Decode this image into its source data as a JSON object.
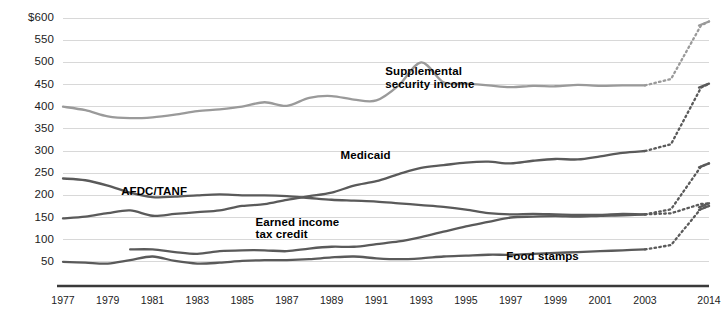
{
  "chart_data": {
    "type": "line",
    "title": "",
    "subtitle": "",
    "xlabel": "",
    "ylabel": "",
    "currency_prefix": "$",
    "units_note": "billions of dollars",
    "xlim": [
      1977,
      2014
    ],
    "ylim": [
      0,
      600
    ],
    "ytick_step": 50,
    "grid": true,
    "legend": "inline-labels",
    "ytick_labels": [
      "$600",
      "550",
      "500",
      "450",
      "400",
      "350",
      "300",
      "250",
      "200",
      "150",
      "100",
      "50"
    ],
    "ytick_values": [
      600,
      550,
      500,
      450,
      400,
      350,
      300,
      250,
      200,
      150,
      100,
      50
    ],
    "xtick_labels": [
      "1977",
      "1979",
      "1981",
      "1983",
      "1985",
      "1987",
      "1989",
      "1991",
      "1993",
      "1995",
      "1997",
      "1999",
      "2001",
      "2003",
      "2014"
    ],
    "xtick_values": [
      1977,
      1979,
      1981,
      1983,
      1985,
      1987,
      1989,
      1991,
      1993,
      1995,
      1997,
      1999,
      2001,
      2003,
      2014
    ],
    "projection_note": "Dotted segments from 2003 to 2014 are projected values",
    "colors": {
      "light_gray_line": "#9a9a9a",
      "dark_gray_line": "#5a5a5a",
      "gridline": "#d8d8d8",
      "axis": "#3a3a3a",
      "text": "#1c1c1c"
    },
    "series": [
      {
        "name": "Supplemental security income",
        "color": "#9a9a9a",
        "label_x": 1991.4,
        "label_y": 478,
        "x": [
          1977,
          1978,
          1979,
          1980,
          1981,
          1982,
          1983,
          1984,
          1985,
          1986,
          1987,
          1988,
          1989,
          1990,
          1991,
          1992,
          1993,
          1994,
          1995,
          1996,
          1997,
          1998,
          1999,
          2000,
          2001,
          2002,
          2003,
          2014
        ],
        "values": [
          400,
          392,
          378,
          374,
          376,
          382,
          390,
          394,
          400,
          410,
          402,
          420,
          424,
          416,
          414,
          448,
          500,
          455,
          452,
          448,
          444,
          447,
          446,
          449,
          447,
          448,
          448,
          592
        ],
        "projected_from": 2003
      },
      {
        "name": "Medicaid",
        "color": "#5a5a5a",
        "label_x": 1989.4,
        "label_y": 288,
        "x": [
          1977,
          1978,
          1979,
          1980,
          1981,
          1982,
          1983,
          1984,
          1985,
          1986,
          1987,
          1988,
          1989,
          1990,
          1991,
          1992,
          1993,
          1994,
          1995,
          1996,
          1997,
          1998,
          1999,
          2000,
          2001,
          2002,
          2003,
          2014
        ],
        "values": [
          148,
          152,
          160,
          166,
          154,
          158,
          162,
          166,
          176,
          180,
          190,
          198,
          206,
          222,
          232,
          248,
          262,
          268,
          274,
          276,
          272,
          278,
          282,
          281,
          288,
          296,
          300,
          452
        ],
        "projected_from": 2003
      },
      {
        "name": "AFDC/TANF",
        "color": "#5a5a5a",
        "label_x": 1979.6,
        "label_y": 208,
        "x": [
          1977,
          1978,
          1979,
          1980,
          1981,
          1982,
          1983,
          1984,
          1985,
          1986,
          1987,
          1988,
          1989,
          1990,
          1991,
          1992,
          1993,
          1994,
          1995,
          1996,
          1997,
          1998,
          1999,
          2000,
          2001,
          2002,
          2003,
          2014
        ],
        "values": [
          238,
          234,
          222,
          206,
          196,
          197,
          200,
          202,
          200,
          200,
          198,
          194,
          190,
          188,
          186,
          182,
          178,
          174,
          168,
          160,
          157,
          158,
          157,
          156,
          156,
          158,
          157,
          272
        ],
        "projected_from": 2003
      },
      {
        "name": "Earned income tax credit",
        "color": "#5a5a5a",
        "label_x": 1985.6,
        "label_y": 138,
        "x": [
          1980,
          1981,
          1982,
          1983,
          1984,
          1985,
          1986,
          1987,
          1988,
          1989,
          1990,
          1991,
          1992,
          1993,
          1994,
          1995,
          1996,
          1997,
          1998,
          1999,
          2000,
          2001,
          2002,
          2003,
          2014
        ],
        "values": [
          78,
          78,
          72,
          68,
          74,
          76,
          76,
          74,
          80,
          84,
          84,
          90,
          96,
          106,
          118,
          130,
          140,
          150,
          152,
          153,
          152,
          154,
          155,
          157,
          182
        ],
        "projected_from": 2003
      },
      {
        "name": "Food stamps",
        "color": "#5a5a5a",
        "label_x": 1996.8,
        "label_y": 62,
        "x": [
          1977,
          1978,
          1979,
          1980,
          1981,
          1982,
          1983,
          1984,
          1985,
          1986,
          1987,
          1988,
          1989,
          1990,
          1991,
          1992,
          1993,
          1994,
          1995,
          1996,
          1997,
          1998,
          1999,
          2000,
          2001,
          2002,
          2003,
          2014
        ],
        "values": [
          50,
          48,
          46,
          54,
          62,
          52,
          46,
          48,
          52,
          54,
          54,
          56,
          60,
          62,
          58,
          56,
          58,
          62,
          64,
          66,
          66,
          68,
          70,
          72,
          74,
          76,
          78,
          176
        ],
        "projected_from": 2003
      }
    ]
  }
}
